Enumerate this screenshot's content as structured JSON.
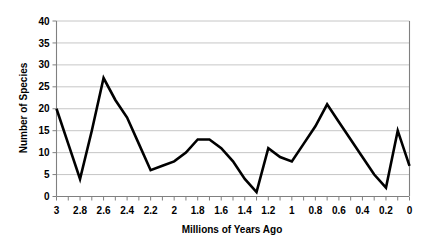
{
  "chart_data": {
    "type": "line",
    "title": "",
    "xlabel": "Millions of Years Ago",
    "ylabel": "Number of Species",
    "xlim": [
      3,
      0
    ],
    "ylim": [
      0,
      40
    ],
    "x_tick_labels": [
      "3",
      "2.8",
      "2.6",
      "2.4",
      "2.2",
      "2",
      "1.8",
      "1.6",
      "1.4",
      "1.2",
      "1",
      "0.8",
      "0.6",
      "0.4",
      "0.2",
      "0"
    ],
    "x_tick_values": [
      3,
      2.8,
      2.6,
      2.4,
      2.2,
      2,
      1.8,
      1.6,
      1.4,
      1.2,
      1,
      0.8,
      0.6,
      0.4,
      0.2,
      0
    ],
    "x_minor_tick_step": 0.1,
    "y_tick_labels": [
      "0",
      "5",
      "10",
      "15",
      "20",
      "25",
      "30",
      "35",
      "40"
    ],
    "y_tick_values": [
      0,
      5,
      10,
      15,
      20,
      25,
      30,
      35,
      40
    ],
    "x_axis_inverted": true,
    "grid": "horizontal",
    "legend": "none",
    "line_color": "#000000",
    "grid_color": "#b8b8b8",
    "axis_color": "#808080",
    "background_color": "#ffffff",
    "series": [
      {
        "name": "Number of Species",
        "x": [
          3.0,
          2.9,
          2.8,
          2.7,
          2.6,
          2.5,
          2.4,
          2.3,
          2.2,
          2.1,
          2.0,
          1.9,
          1.8,
          1.7,
          1.6,
          1.5,
          1.4,
          1.3,
          1.2,
          1.1,
          1.0,
          0.9,
          0.8,
          0.7,
          0.6,
          0.5,
          0.4,
          0.3,
          0.2,
          0.1,
          0.0
        ],
        "values": [
          20,
          12,
          4,
          15,
          27,
          22,
          18,
          12,
          6,
          7,
          8,
          10,
          13,
          13,
          11,
          8,
          4,
          1,
          11,
          9,
          8,
          12,
          16,
          21,
          17,
          13,
          9,
          5,
          2,
          15,
          7
        ]
      }
    ]
  }
}
